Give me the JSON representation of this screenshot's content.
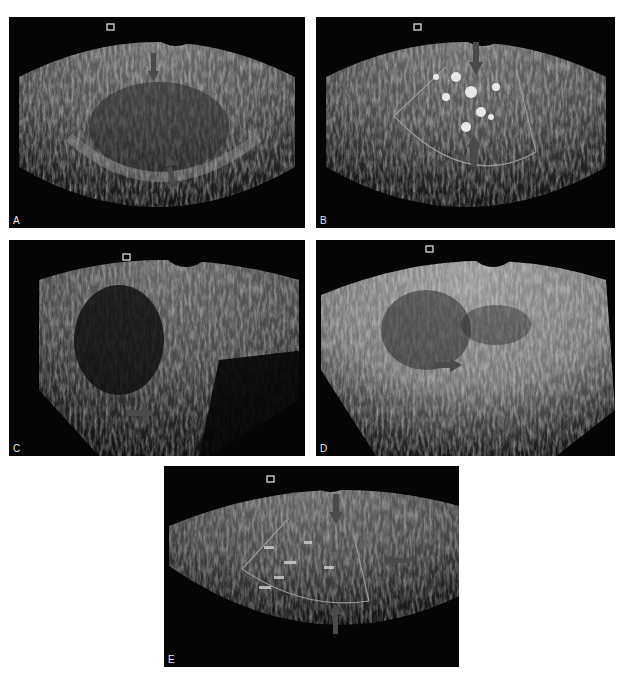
{
  "figure": {
    "panels": [
      {
        "id": "A",
        "label": "A",
        "content": "grayscale transvaginal ultrasound, two arrows",
        "arrow_color": "#4a4a4a"
      },
      {
        "id": "B",
        "label": "B",
        "content": "color Doppler ultrasound with sector box, two arrows",
        "arrow_color": "#4a4a4a"
      },
      {
        "id": "C",
        "label": "C",
        "content": "grayscale transvaginal ultrasound, one arrow",
        "arrow_color": "#4a4a4a"
      },
      {
        "id": "D",
        "label": "D",
        "content": "grayscale transvaginal ultrasound, one arrow",
        "arrow_color": "#4a4a4a"
      },
      {
        "id": "E",
        "label": "E",
        "content": "Doppler ultrasound with sector box, three arrows",
        "arrow_color": "#4a4a4a"
      }
    ],
    "icons": {
      "probe_marker": "probe-orientation-marker-icon",
      "arrow": "arrow-icon"
    },
    "colors": {
      "background": "#ffffff",
      "panel_bg": "#050505",
      "tissue": "#8a8a8a",
      "label": "#e8e8e8"
    }
  }
}
